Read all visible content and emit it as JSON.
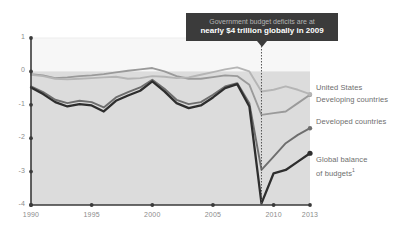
{
  "callout": {
    "line1": "Government budget deficits are at",
    "line2": "nearly $4 trillion globally in 2009",
    "marker_year": 2009
  },
  "legend": {
    "items": [
      {
        "label": "United States",
        "color": "#9a9a9a"
      },
      {
        "label": "Developing countries",
        "color": "#b5b5b5"
      },
      {
        "label": "Developed countries",
        "color": "#6e6e6e"
      },
      {
        "label": "Global balance",
        "label2": "of budgets",
        "footnote": "1",
        "color": "#2e2e2e"
      }
    ]
  },
  "colors": {
    "plot_background": "#dcdcdc",
    "above_zero_band": "#f7f7f7",
    "axis": "#3a3a3a",
    "gridline": "#ededed",
    "tick_text": "#8b8b8b",
    "callout_background": "#3b3b3b"
  },
  "chart_data": {
    "type": "line",
    "title": "",
    "subtitle": "",
    "xlabel": "",
    "ylabel": "",
    "xlim": [
      1990,
      2013
    ],
    "ylim": [
      -4,
      1
    ],
    "xticks": [
      1990,
      1995,
      2000,
      2005,
      2010,
      2013
    ],
    "xtick_labels": [
      "1990",
      "1995",
      "2000",
      "2005",
      "2010",
      "2013"
    ],
    "yticks": [
      1,
      0,
      -1,
      -2,
      -3,
      -4
    ],
    "ytick_labels": [
      "1",
      "0",
      "-1",
      "-2",
      "-3",
      "-4"
    ],
    "grid": false,
    "legend_position": "right",
    "x": [
      1990,
      1991,
      1992,
      1993,
      1994,
      1995,
      1996,
      1997,
      1998,
      1999,
      2000,
      2001,
      2002,
      2003,
      2004,
      2005,
      2006,
      2007,
      2008,
      2009,
      2010,
      2011,
      2012,
      2013
    ],
    "series": [
      {
        "name": "United States",
        "color": "#9a9a9a",
        "values": [
          -0.08,
          -0.12,
          -0.2,
          -0.18,
          -0.14,
          -0.12,
          -0.08,
          -0.03,
          0.02,
          0.06,
          0.1,
          0.0,
          -0.14,
          -0.22,
          -0.22,
          -0.17,
          -0.12,
          -0.14,
          -0.4,
          -1.3,
          -1.25,
          -1.2,
          -0.95,
          -0.7
        ]
      },
      {
        "name": "Developing countries",
        "color": "#b5b5b5",
        "values": [
          -0.1,
          -0.14,
          -0.22,
          -0.24,
          -0.22,
          -0.2,
          -0.18,
          -0.16,
          -0.22,
          -0.2,
          -0.14,
          -0.16,
          -0.2,
          -0.18,
          -0.1,
          -0.02,
          0.06,
          0.12,
          0.0,
          -0.6,
          -0.55,
          -0.45,
          -0.55,
          -0.68
        ]
      },
      {
        "name": "Developed countries",
        "color": "#6e6e6e",
        "values": [
          -0.45,
          -0.62,
          -0.85,
          -0.95,
          -0.88,
          -0.92,
          -1.08,
          -0.78,
          -0.62,
          -0.48,
          -0.25,
          -0.52,
          -0.85,
          -0.98,
          -0.92,
          -0.7,
          -0.45,
          -0.35,
          -0.95,
          -2.95,
          -2.55,
          -2.15,
          -1.9,
          -1.7
        ]
      },
      {
        "name": "Global balance of budgets",
        "color": "#2e2e2e",
        "values": [
          -0.48,
          -0.68,
          -0.92,
          -1.05,
          -0.98,
          -1.02,
          -1.2,
          -0.88,
          -0.72,
          -0.58,
          -0.3,
          -0.6,
          -0.95,
          -1.1,
          -1.02,
          -0.78,
          -0.5,
          -0.38,
          -1.05,
          -3.95,
          -3.05,
          -2.95,
          -2.7,
          -2.45
        ]
      }
    ]
  }
}
